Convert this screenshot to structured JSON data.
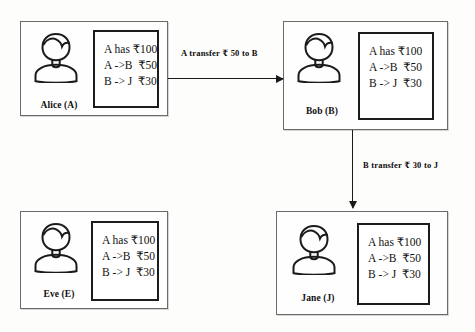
{
  "diagram": {
    "ledger_lines": [
      "A has ₹100",
      "A ->B  ₹50",
      "B -> J  ₹30"
    ],
    "nodes": [
      {
        "id": "alice",
        "label": "Alice (A)",
        "avatar_icon": "person-avatar-icon",
        "ledger": [
          "A has ₹100",
          "A ->B  ₹50",
          "B -> J  ₹30"
        ]
      },
      {
        "id": "bob",
        "label": "Bob (B)",
        "avatar_icon": "person-avatar-icon",
        "ledger": [
          "A has ₹100",
          "A ->B  ₹50",
          "B -> J  ₹30"
        ]
      },
      {
        "id": "eve",
        "label": "Eve (E)",
        "avatar_icon": "person-avatar-icon",
        "ledger": [
          "A has ₹100",
          "A ->B  ₹50",
          "B -> J  ₹30"
        ]
      },
      {
        "id": "jane",
        "label": "Jane (J)",
        "avatar_icon": "person-avatar-icon",
        "ledger": [
          "A has ₹100",
          "A ->B  ₹50",
          "B -> J  ₹30"
        ]
      }
    ],
    "edges": [
      {
        "id": "alice-to-bob",
        "label": "A transfer ₹ 50 to B",
        "from": "alice",
        "to": "bob",
        "direction": "horizontal"
      },
      {
        "id": "bob-to-jane",
        "label": "B transfer ₹ 30 to J",
        "from": "bob",
        "to": "jane",
        "direction": "vertical"
      }
    ],
    "colors": {
      "node_border": "#6b6b6b",
      "ledger_border": "#1c1c1c",
      "arrow": "#1a1a1a",
      "text": "#111111",
      "background": "#fdfdfc"
    }
  }
}
